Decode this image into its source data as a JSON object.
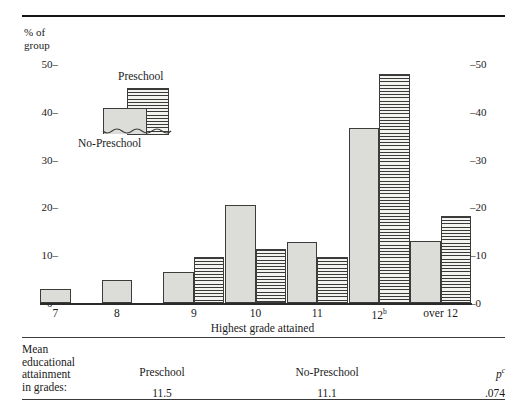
{
  "chart_data": {
    "type": "bar",
    "title": "",
    "xlabel": "Highest grade attained",
    "ylabel": "% of\ngroup",
    "ylim": [
      0,
      52
    ],
    "grid": false,
    "legend_position": "inside-top-left",
    "categories": [
      "7",
      "8",
      "9",
      "10",
      "11",
      "12",
      "over 12"
    ],
    "category_labels": [
      "7",
      "8",
      "9",
      "10",
      "11",
      "12<sup>b</sup>",
      "over 12"
    ],
    "series": [
      {
        "name": "No-Preschool",
        "style": "solid-gray",
        "values": [
          2.9,
          4.8,
          6.5,
          20.6,
          12.7,
          36.6,
          12.9
        ]
      },
      {
        "name": "Preschool",
        "style": "horizontal-stripes",
        "values": [
          null,
          null,
          9.6,
          11.3,
          9.6,
          47.9,
          18.1
        ]
      }
    ],
    "y_ticks_left": [
      "50",
      "40",
      "30",
      "20",
      "10",
      "0"
    ],
    "y_ticks_right": [
      "50",
      "40",
      "30",
      "20",
      "10",
      "0"
    ],
    "tick_dash": "–"
  },
  "legend": {
    "preschool_label": "Preschool",
    "no_preschool_label": "No-Preschool"
  },
  "footer": {
    "stub": "Mean\neducational\nattainment\nin grades:",
    "col_preschool": "Preschool",
    "col_no_preschool": "No-Preschool",
    "col_p": "p",
    "col_p_sup": "c",
    "val_preschool": "11.5",
    "val_no_preschool": "11.1",
    "val_p": ".074"
  }
}
